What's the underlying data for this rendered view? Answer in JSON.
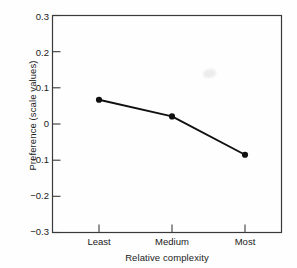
{
  "chart_data": {
    "type": "line",
    "title": "",
    "subtitle": "",
    "xlabel": "Relative complexity",
    "ylabel": "Preference (scale values)",
    "categories": [
      "Least",
      "Medium",
      "Most"
    ],
    "values": [
      0.067,
      0.021,
      -0.085
    ],
    "series": [
      {
        "name": "Preference",
        "values": [
          0.067,
          0.021,
          -0.085
        ]
      }
    ],
    "ylim": [
      -0.3,
      0.3
    ],
    "yticks": [
      0.3,
      0.2,
      0.1,
      0,
      -0.1,
      -0.2,
      -0.3
    ],
    "ytick_labels": [
      "0.3",
      "0.2",
      "0.1",
      "0",
      "−0.1",
      "−0.2",
      "−0.3"
    ],
    "xticks": [
      0,
      1,
      2
    ],
    "xtick_labels": [
      "Least",
      "Medium",
      "Most"
    ],
    "grid": false,
    "legend": null,
    "legend_position": "none",
    "marker": "filled-circle",
    "line_color": "#101010",
    "marker_color": "#101010",
    "background_color": "#ffffff",
    "frame_color": "#333333",
    "annotations": []
  },
  "figure": {
    "alt_name": "preference-vs-relative-complexity-line-chart"
  }
}
